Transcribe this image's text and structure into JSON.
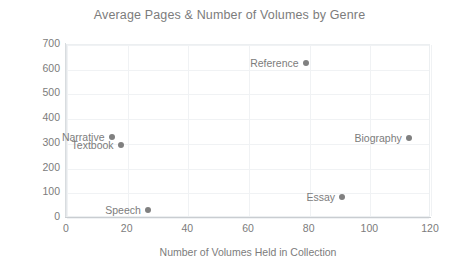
{
  "chart_data": {
    "type": "scatter",
    "title": "Average Pages & Number of Volumes by Genre",
    "xlabel": "Number of Volumes Held in Collection",
    "ylabel": "Average Number of Pages per Volume",
    "xlim": [
      0,
      120
    ],
    "ylim": [
      0,
      700
    ],
    "xticks": [
      "0",
      "20",
      "40",
      "60",
      "80",
      "100",
      "120"
    ],
    "yticks": [
      "0",
      "100",
      "200",
      "300",
      "400",
      "500",
      "600",
      "700"
    ],
    "grid": true,
    "legend": "none",
    "marker_color": "#808080",
    "points": [
      {
        "label": "Narrative",
        "x": 15,
        "y": 325,
        "label_side": "left"
      },
      {
        "label": "Textbook",
        "x": 18,
        "y": 290,
        "label_side": "left"
      },
      {
        "label": "Speech",
        "x": 27,
        "y": 28,
        "label_side": "left"
      },
      {
        "label": "Reference",
        "x": 79,
        "y": 625,
        "label_side": "left"
      },
      {
        "label": "Essay",
        "x": 91,
        "y": 80,
        "label_side": "left"
      },
      {
        "label": "Biography",
        "x": 113,
        "y": 320,
        "label_side": "left"
      }
    ]
  }
}
